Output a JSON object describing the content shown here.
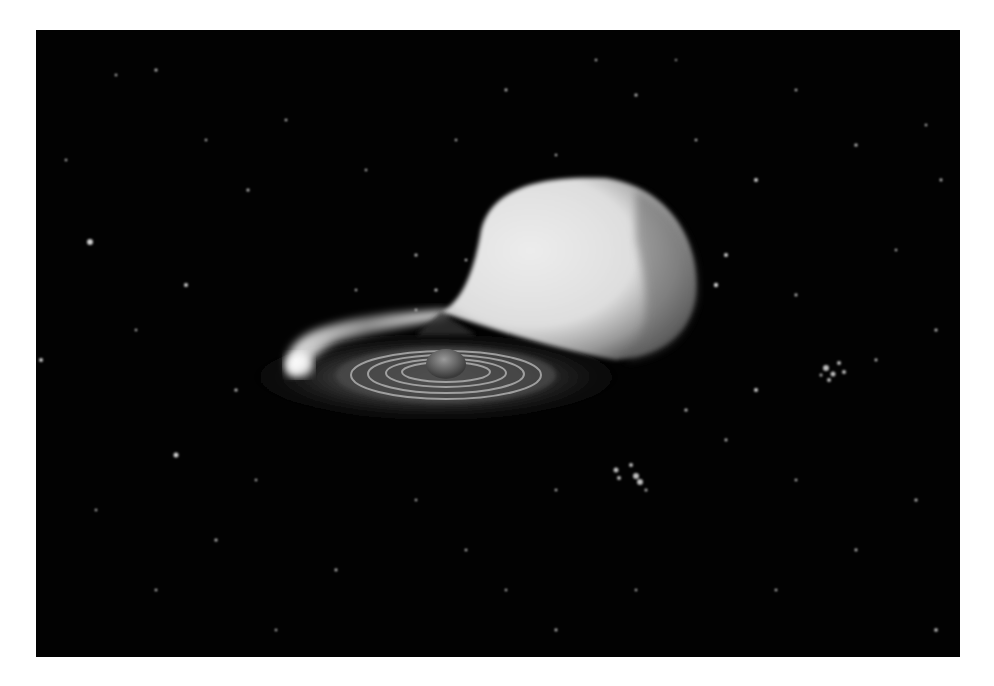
{
  "image": {
    "description": "Grayscale artist rendering of an interacting binary star system: a large tear-drop shaped star transferring a stream of gas onto an accretion disk around a compact companion, set against a star field.",
    "colors": {
      "background_page": "#ffffff",
      "space": "#020202",
      "star_light": "#e6e6e6",
      "star_shadow": "#5a5a5a",
      "disk": "#3a3a3a",
      "stream": "#d8d8d8"
    },
    "elements": [
      {
        "name": "donor-star",
        "shape": "tear-drop sphere"
      },
      {
        "name": "gas-stream",
        "shape": "bright curved stream"
      },
      {
        "name": "accretion-disk",
        "shape": "elliptical ringed disk"
      },
      {
        "name": "compact-star",
        "shape": "small central sphere"
      },
      {
        "name": "star-field",
        "shape": "scattered points"
      }
    ]
  }
}
